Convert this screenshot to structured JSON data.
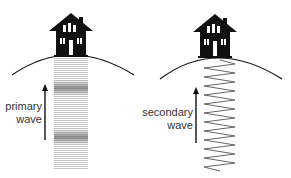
{
  "panels": [
    {
      "id": "primary",
      "label_line1": "primary",
      "label_line2": "wave",
      "wave_style": "compression"
    },
    {
      "id": "secondary",
      "label_line1": "secondary",
      "label_line2": "wave",
      "wave_style": "zigzag"
    }
  ],
  "colors": {
    "ink": "#111111",
    "text": "#333333",
    "wave_light": "#bdbdbd",
    "wave_dense": "#707070"
  }
}
